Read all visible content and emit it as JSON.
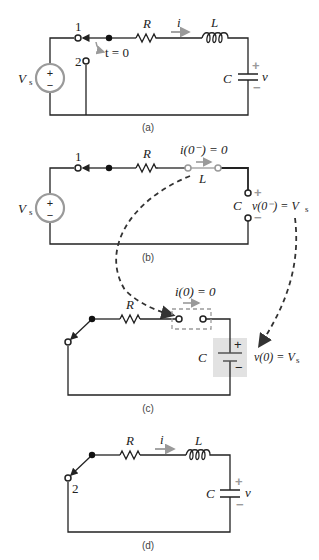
{
  "figure": {
    "panels": [
      {
        "id": "a",
        "caption": "(a)",
        "source_label": "V",
        "source_sub": "s",
        "source_plus": "+",
        "source_minus": "−",
        "terminal_1": "1",
        "terminal_2": "2",
        "switch_time": "t = 0",
        "resistor": "R",
        "current": "i",
        "inductor": "L",
        "capacitor": "C",
        "cap_voltage": "v",
        "cap_plus": "+",
        "cap_minus": "−"
      },
      {
        "id": "b",
        "caption": "(b)",
        "source_label": "V",
        "source_sub": "s",
        "source_plus": "+",
        "source_minus": "−",
        "terminal_1": "1",
        "resistor": "R",
        "current_eq": "i(0⁻) = 0",
        "inductor": "L",
        "capacitor": "C",
        "cap_voltage_eq": "v(0⁻) = V",
        "cap_voltage_sub": "s",
        "cap_plus": "+",
        "cap_minus": "−"
      },
      {
        "id": "c",
        "caption": "(c)",
        "resistor": "R",
        "current_eq": "i(0) = 0",
        "capacitor": "C",
        "cap_voltage_eq": "v(0) = V",
        "cap_voltage_sub": "s",
        "cap_plus": "+",
        "cap_minus": "−"
      },
      {
        "id": "d",
        "caption": "(d)",
        "terminal_2": "2",
        "resistor": "R",
        "current": "i",
        "inductor": "L",
        "capacitor": "C",
        "cap_voltage": "v",
        "cap_plus": "+",
        "cap_minus": "−"
      }
    ],
    "colors": {
      "wire": "#222222",
      "accent_gray": "#9a9a9a",
      "shade": "#e2e2e2"
    }
  }
}
